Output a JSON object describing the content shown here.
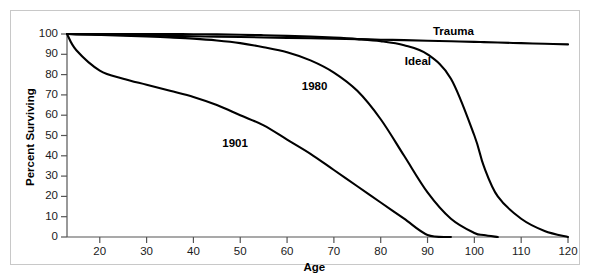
{
  "chart_data": {
    "type": "line",
    "title": "",
    "subtitle": "",
    "xlabel": "Age",
    "ylabel": "Percent Surviving",
    "xlim": [
      13,
      120
    ],
    "ylim": [
      0,
      100
    ],
    "grid": false,
    "legend_position": "inline-curve-labels",
    "xticks": [
      20,
      30,
      40,
      50,
      60,
      70,
      80,
      90,
      100,
      110,
      120
    ],
    "yticks": [
      0,
      10,
      20,
      30,
      40,
      50,
      60,
      70,
      80,
      90,
      100
    ],
    "x": [
      13,
      15,
      20,
      25,
      30,
      35,
      40,
      45,
      50,
      55,
      60,
      65,
      70,
      75,
      80,
      85,
      90,
      95,
      100,
      102,
      105,
      110,
      115,
      120
    ],
    "series": [
      {
        "name": "1901",
        "label": "1901",
        "label_x": 50,
        "label_y": 46,
        "values": [
          100,
          92,
          82,
          78,
          75,
          72,
          69,
          65,
          60,
          55,
          48,
          41,
          33,
          25,
          17,
          9,
          1,
          0,
          0,
          0,
          0,
          0,
          0,
          0
        ]
      },
      {
        "name": "1980",
        "label": "1980",
        "label_x": 67,
        "label_y": 74,
        "values": [
          100,
          99.8,
          99.5,
          99.2,
          98.8,
          98.3,
          97.7,
          96.8,
          95.5,
          93.5,
          91,
          87,
          81,
          72,
          58,
          40,
          22,
          9,
          2,
          1,
          0,
          0,
          0,
          0
        ]
      },
      {
        "name": "Ideal",
        "label": "Ideal",
        "label_x": 89,
        "label_y": 86,
        "values": [
          100,
          100,
          100,
          100,
          100,
          100,
          99.9,
          99.8,
          99.6,
          99.4,
          99.1,
          98.7,
          98.2,
          97.5,
          96.5,
          94.5,
          90,
          78,
          50,
          35,
          20,
          9,
          3,
          0
        ]
      },
      {
        "name": "Trauma",
        "label": "Trauma",
        "label_x": 95,
        "label_y": 101,
        "values": [
          100,
          99.9,
          99.7,
          99.5,
          99.3,
          99.1,
          98.9,
          98.7,
          98.5,
          98.3,
          98.1,
          97.9,
          97.7,
          97.5,
          97.2,
          97.0,
          96.7,
          96.4,
          96.1,
          96.0,
          95.8,
          95.5,
          95.2,
          94.9
        ]
      }
    ],
    "colors": {
      "line": "#000000",
      "axis": "#555555",
      "frame": "#c8c8c8",
      "background": "#ffffff",
      "text": "#000000"
    }
  }
}
